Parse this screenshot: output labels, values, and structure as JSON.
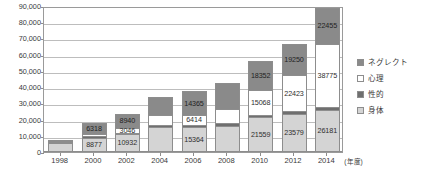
{
  "chart_data": {
    "type": "bar",
    "stacked": true,
    "title": "",
    "subtitle": "",
    "xlabel": "年度",
    "ylabel": "",
    "categories": [
      "1998",
      "2000",
      "2002",
      "2004",
      "2006",
      "2008",
      "2010",
      "2012",
      "2014"
    ],
    "ylim": [
      0,
      90000
    ],
    "yticks": [
      0,
      10000,
      20000,
      30000,
      40000,
      50000,
      60000,
      70000,
      80000,
      90000
    ],
    "ytick_labels": [
      "0",
      "10,000",
      "20,000",
      "30,000",
      "40,000",
      "50,000",
      "60,000",
      "70,000",
      "80,000",
      "90,000"
    ],
    "grid": true,
    "legend_position": "right",
    "series": [
      {
        "name": "身体",
        "key": "physical",
        "color": "#d4d4d4",
        "values": [
          5400,
          8877,
          10932,
          15364,
          15364,
          16296,
          21559,
          23579,
          26181
        ],
        "labels": [
          "",
          "8877",
          "10932",
          "",
          "15364",
          "",
          "21559",
          "23579",
          "26181"
        ]
      },
      {
        "name": "性的",
        "key": "sexual",
        "color": "#6f6f6f",
        "values": [
          600,
          754,
          778,
          1048,
          1180,
          1324,
          1405,
          1449,
          1520
        ],
        "labels": [
          "",
          "",
          "",
          "",
          "",
          "",
          "",
          "",
          ""
        ]
      },
      {
        "name": "心理",
        "key": "psych",
        "color": "#ffffff",
        "values": [
          600,
          1776,
          3046,
          6414,
          6414,
          9092,
          15068,
          22423,
          38775
        ],
        "labels": [
          "",
          "",
          "3046",
          "",
          "6414",
          "",
          "15068",
          "22423",
          "38775"
        ]
      },
      {
        "name": "ネグレクト",
        "key": "neglect",
        "color": "#8a8a8a",
        "values": [
          1000,
          6318,
          8940,
          11100,
          14365,
          15905,
          18352,
          19250,
          22455
        ],
        "labels": [
          "",
          "6318",
          "8940",
          "",
          "14365",
          "",
          "18352",
          "19250",
          "22455"
        ]
      }
    ]
  },
  "legend": {
    "items": [
      {
        "label": "ネグレクト",
        "swatch": "neglect"
      },
      {
        "label": "心理",
        "swatch": "psych"
      },
      {
        "label": "性的",
        "swatch": "sexual"
      },
      {
        "label": "身体",
        "swatch": "physical"
      }
    ]
  },
  "axis": {
    "x_unit_label": "(年度)"
  }
}
